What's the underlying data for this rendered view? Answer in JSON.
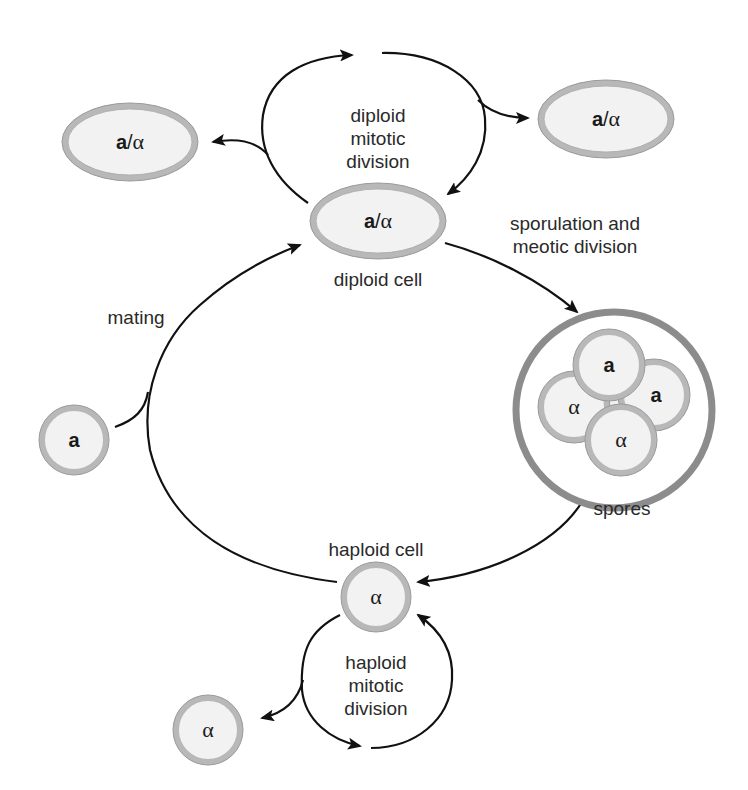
{
  "diagram": {
    "labels": {
      "diploid_mitotic": [
        "diploid",
        "mitotic",
        "division"
      ],
      "sporulation": [
        "sporulation and",
        "meotic division"
      ],
      "diploid_cell": "diploid cell",
      "mating": "mating",
      "spores": "spores",
      "haploid_cell": "haploid cell",
      "haploid_mitotic": [
        "haploid",
        "mitotic",
        "division"
      ]
    },
    "cells": {
      "diploid_center": {
        "bold": "a",
        "sep": "/",
        "greek": "α"
      },
      "diploid_left": {
        "bold": "a",
        "sep": "/",
        "greek": "α"
      },
      "diploid_right": {
        "bold": "a",
        "sep": "/",
        "greek": "α"
      },
      "haploid_a_left": {
        "bold": "a"
      },
      "haploid_center": {
        "greek": "α"
      },
      "haploid_bottom_left": {
        "greek": "α"
      },
      "spore_top": {
        "bold": "a"
      },
      "spore_left": {
        "greek": "α"
      },
      "spore_right": {
        "bold": "a"
      },
      "spore_bottom": {
        "greek": "α"
      }
    },
    "colors": {
      "cell_wall": "#b8b8b8",
      "cell_wall_outline": "#9a9a9a",
      "cell_fill": "#f2f2f2",
      "ascus_wall": "#8c8c8c",
      "arrow": "#111111",
      "text": "#2a2a2a"
    }
  }
}
